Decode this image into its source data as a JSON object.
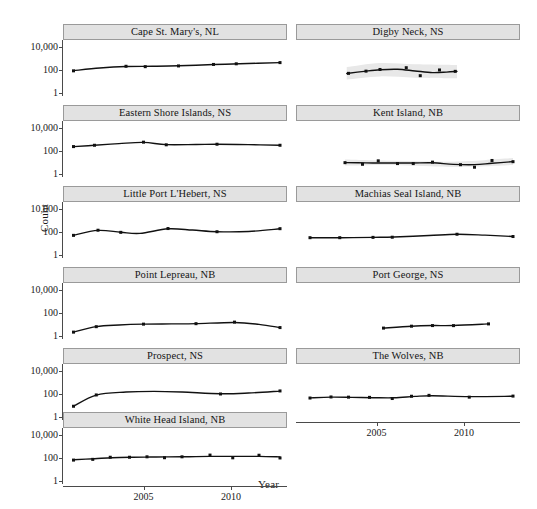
{
  "chart_data": {
    "type": "line",
    "title": "",
    "xlabel": "Year",
    "ylabel": "Count",
    "yscale": "log10",
    "ylim": [
      0.5,
      40000
    ],
    "yticks": [
      1,
      100,
      10000
    ],
    "ytick_labels": [
      "1",
      "100",
      "10,000"
    ],
    "xlim": [
      2000.4,
      2013.2
    ],
    "xticks": [
      2005,
      2010
    ],
    "xtick_labels": [
      "2005",
      "2010"
    ],
    "grid": false,
    "legend": null,
    "layout": {
      "rows": 6,
      "cols": 2,
      "strip_position": "top"
    },
    "marker": "filled-square",
    "line_color": "#111111",
    "band_color": "#e8e8e8",
    "strip_fill": "#e2e2e2",
    "panels": [
      {
        "id": "cape-st-marys-nl",
        "label": "Cape St. Mary's, NL",
        "row": 0,
        "col": 0,
        "has_band": false,
        "points": [
          {
            "x": 2001.0,
            "y": 80
          },
          {
            "x": 2004.0,
            "y": 200
          },
          {
            "x": 2005.1,
            "y": 185
          },
          {
            "x": 2007.0,
            "y": 215
          },
          {
            "x": 2009.0,
            "y": 290
          },
          {
            "x": 2010.3,
            "y": 330
          },
          {
            "x": 2012.8,
            "y": 420
          }
        ],
        "fit": [
          {
            "x": 2001.0,
            "y": 82
          },
          {
            "x": 2002.5,
            "y": 140
          },
          {
            "x": 2004.0,
            "y": 190
          },
          {
            "x": 2005.5,
            "y": 200
          },
          {
            "x": 2007.0,
            "y": 220
          },
          {
            "x": 2009.0,
            "y": 285
          },
          {
            "x": 2010.5,
            "y": 330
          },
          {
            "x": 2012.8,
            "y": 420
          }
        ]
      },
      {
        "id": "digby-neck-ns",
        "label": "Digby Neck, NS",
        "row": 0,
        "col": 1,
        "has_band": true,
        "points": [
          {
            "x": 2003.4,
            "y": 48
          },
          {
            "x": 2004.4,
            "y": 75
          },
          {
            "x": 2005.2,
            "y": 105
          },
          {
            "x": 2006.7,
            "y": 150
          },
          {
            "x": 2007.5,
            "y": 30
          },
          {
            "x": 2008.6,
            "y": 95
          },
          {
            "x": 2009.5,
            "y": 72
          }
        ],
        "fit": [
          {
            "x": 2003.3,
            "y": 47
          },
          {
            "x": 2004.3,
            "y": 72
          },
          {
            "x": 2005.2,
            "y": 100
          },
          {
            "x": 2006.2,
            "y": 110
          },
          {
            "x": 2007.2,
            "y": 78
          },
          {
            "x": 2008.2,
            "y": 56
          },
          {
            "x": 2009.0,
            "y": 62
          },
          {
            "x": 2009.6,
            "y": 72
          }
        ],
        "band": [
          {
            "x": 2003.3,
            "lo": 14,
            "hi": 170
          },
          {
            "x": 2005.2,
            "lo": 26,
            "hi": 390
          },
          {
            "x": 2007.2,
            "lo": 20,
            "hi": 300
          },
          {
            "x": 2009.6,
            "lo": 18,
            "hi": 260
          }
        ]
      },
      {
        "id": "eastern-shore-islands-ns",
        "label": "Eastern Shore Islands, NS",
        "row": 1,
        "col": 0,
        "has_band": false,
        "points": [
          {
            "x": 2001.0,
            "y": 230
          },
          {
            "x": 2002.2,
            "y": 300
          },
          {
            "x": 2005.0,
            "y": 560
          },
          {
            "x": 2006.3,
            "y": 330
          },
          {
            "x": 2009.2,
            "y": 370
          },
          {
            "x": 2012.8,
            "y": 300
          }
        ],
        "fit": [
          {
            "x": 2001.0,
            "y": 230
          },
          {
            "x": 2002.2,
            "y": 300
          },
          {
            "x": 2003.6,
            "y": 420
          },
          {
            "x": 2005.0,
            "y": 540
          },
          {
            "x": 2006.3,
            "y": 340
          },
          {
            "x": 2008.0,
            "y": 350
          },
          {
            "x": 2009.2,
            "y": 370
          },
          {
            "x": 2011.0,
            "y": 340
          },
          {
            "x": 2012.8,
            "y": 300
          }
        ]
      },
      {
        "id": "kent-island-nb",
        "label": "Kent Island, NB",
        "row": 1,
        "col": 1,
        "has_band": true,
        "points": [
          {
            "x": 2003.2,
            "y": 9
          },
          {
            "x": 2004.2,
            "y": 6.5
          },
          {
            "x": 2005.1,
            "y": 13
          },
          {
            "x": 2006.2,
            "y": 7.5
          },
          {
            "x": 2007.1,
            "y": 7.5
          },
          {
            "x": 2008.2,
            "y": 10
          },
          {
            "x": 2009.8,
            "y": 6
          },
          {
            "x": 2010.6,
            "y": 3.6
          },
          {
            "x": 2011.6,
            "y": 14
          },
          {
            "x": 2012.8,
            "y": 11
          }
        ],
        "fit": [
          {
            "x": 2003.2,
            "y": 9.0
          },
          {
            "x": 2004.4,
            "y": 8.6
          },
          {
            "x": 2005.6,
            "y": 8.4
          },
          {
            "x": 2007.0,
            "y": 8.4
          },
          {
            "x": 2008.2,
            "y": 8.8
          },
          {
            "x": 2009.4,
            "y": 6.4
          },
          {
            "x": 2010.6,
            "y": 6.0
          },
          {
            "x": 2011.6,
            "y": 8.0
          },
          {
            "x": 2012.8,
            "y": 11.0
          }
        ],
        "band": [
          {
            "x": 2003.2,
            "lo": 5.0,
            "hi": 17
          },
          {
            "x": 2006.0,
            "lo": 5.6,
            "hi": 13
          },
          {
            "x": 2009.4,
            "lo": 3.8,
            "hi": 11
          },
          {
            "x": 2012.8,
            "lo": 5.5,
            "hi": 23
          }
        ]
      },
      {
        "id": "little-port-lhebert-ns",
        "label": "Little Port L'Hebert, NS",
        "row": 2,
        "col": 0,
        "has_band": false,
        "points": [
          {
            "x": 2001.0,
            "y": 48
          },
          {
            "x": 2002.4,
            "y": 135
          },
          {
            "x": 2003.7,
            "y": 88
          },
          {
            "x": 2006.4,
            "y": 190
          },
          {
            "x": 2009.2,
            "y": 100
          },
          {
            "x": 2012.8,
            "y": 185
          }
        ],
        "fit": [
          {
            "x": 2001.0,
            "y": 50
          },
          {
            "x": 2002.4,
            "y": 130
          },
          {
            "x": 2003.7,
            "y": 90
          },
          {
            "x": 2004.8,
            "y": 72
          },
          {
            "x": 2006.4,
            "y": 180
          },
          {
            "x": 2007.8,
            "y": 140
          },
          {
            "x": 2009.2,
            "y": 100
          },
          {
            "x": 2011.0,
            "y": 105
          },
          {
            "x": 2012.8,
            "y": 180
          }
        ]
      },
      {
        "id": "machias-seal-island-nb",
        "label": "Machias Seal Island, NB",
        "row": 2,
        "col": 1,
        "has_band": false,
        "points": [
          {
            "x": 2001.2,
            "y": 30
          },
          {
            "x": 2002.9,
            "y": 30
          },
          {
            "x": 2004.8,
            "y": 32
          },
          {
            "x": 2005.9,
            "y": 33
          },
          {
            "x": 2009.6,
            "y": 60
          },
          {
            "x": 2012.8,
            "y": 38
          }
        ],
        "fit": [
          {
            "x": 2001.2,
            "y": 30
          },
          {
            "x": 2003.0,
            "y": 30
          },
          {
            "x": 2004.8,
            "y": 32
          },
          {
            "x": 2006.0,
            "y": 34
          },
          {
            "x": 2008.0,
            "y": 46
          },
          {
            "x": 2009.6,
            "y": 60
          },
          {
            "x": 2011.2,
            "y": 50
          },
          {
            "x": 2012.8,
            "y": 38
          }
        ]
      },
      {
        "id": "point-lepreau-nb",
        "label": "Point Lepreau, NB",
        "row": 3,
        "col": 0,
        "has_band": false,
        "points": [
          {
            "x": 2001.0,
            "y": 2.0
          },
          {
            "x": 2002.3,
            "y": 6.0
          },
          {
            "x": 2005.0,
            "y": 10
          },
          {
            "x": 2008.0,
            "y": 11
          },
          {
            "x": 2010.2,
            "y": 15
          },
          {
            "x": 2012.8,
            "y": 5.0
          }
        ],
        "fit": [
          {
            "x": 2001.0,
            "y": 2.0
          },
          {
            "x": 2002.3,
            "y": 6.0
          },
          {
            "x": 2003.6,
            "y": 8.4
          },
          {
            "x": 2005.0,
            "y": 10
          },
          {
            "x": 2006.6,
            "y": 10.5
          },
          {
            "x": 2008.0,
            "y": 11
          },
          {
            "x": 2010.2,
            "y": 14
          },
          {
            "x": 2011.6,
            "y": 9.5
          },
          {
            "x": 2012.8,
            "y": 5.0
          }
        ]
      },
      {
        "id": "port-george-ns",
        "label": "Port George, NS",
        "row": 3,
        "col": 1,
        "has_band": false,
        "points": [
          {
            "x": 2005.4,
            "y": 4.5
          },
          {
            "x": 2007.0,
            "y": 6.6
          },
          {
            "x": 2008.2,
            "y": 7.5
          },
          {
            "x": 2009.4,
            "y": 7.4
          },
          {
            "x": 2011.4,
            "y": 10.5
          }
        ],
        "fit": [
          {
            "x": 2005.4,
            "y": 4.5
          },
          {
            "x": 2007.0,
            "y": 6.6
          },
          {
            "x": 2008.2,
            "y": 7.5
          },
          {
            "x": 2009.4,
            "y": 7.6
          },
          {
            "x": 2011.4,
            "y": 10.5
          }
        ]
      },
      {
        "id": "prospect-ns",
        "label": "Prospect, NS",
        "row": 4,
        "col": 0,
        "has_band": false,
        "points": [
          {
            "x": 2001.0,
            "y": 8
          },
          {
            "x": 2002.3,
            "y": 78
          },
          {
            "x": 2009.4,
            "y": 95
          },
          {
            "x": 2012.8,
            "y": 175
          }
        ],
        "fit": [
          {
            "x": 2001.0,
            "y": 8
          },
          {
            "x": 2002.3,
            "y": 76
          },
          {
            "x": 2004.0,
            "y": 140
          },
          {
            "x": 2005.6,
            "y": 160
          },
          {
            "x": 2007.2,
            "y": 140
          },
          {
            "x": 2009.4,
            "y": 100
          },
          {
            "x": 2011.0,
            "y": 115
          },
          {
            "x": 2012.8,
            "y": 170
          }
        ]
      },
      {
        "id": "the-wolves-nb",
        "label": "The Wolves, NB",
        "row": 4,
        "col": 1,
        "has_band": false,
        "points": [
          {
            "x": 2001.2,
            "y": 42
          },
          {
            "x": 2002.4,
            "y": 52
          },
          {
            "x": 2003.4,
            "y": 50
          },
          {
            "x": 2004.6,
            "y": 48
          },
          {
            "x": 2005.9,
            "y": 38
          },
          {
            "x": 2007.0,
            "y": 60
          },
          {
            "x": 2008.0,
            "y": 72
          },
          {
            "x": 2010.3,
            "y": 50
          },
          {
            "x": 2012.8,
            "y": 62
          }
        ],
        "fit": [
          {
            "x": 2001.2,
            "y": 43
          },
          {
            "x": 2002.4,
            "y": 50
          },
          {
            "x": 2003.6,
            "y": 48
          },
          {
            "x": 2004.8,
            "y": 45
          },
          {
            "x": 2006.0,
            "y": 44
          },
          {
            "x": 2007.2,
            "y": 58
          },
          {
            "x": 2008.2,
            "y": 66
          },
          {
            "x": 2010.3,
            "y": 56
          },
          {
            "x": 2012.8,
            "y": 60
          }
        ]
      },
      {
        "id": "white-head-island-nb",
        "label": "White Head Island, NB",
        "row": 5,
        "col": 0,
        "has_band": false,
        "points": [
          {
            "x": 2001.0,
            "y": 62
          },
          {
            "x": 2002.1,
            "y": 72
          },
          {
            "x": 2003.1,
            "y": 110
          },
          {
            "x": 2004.2,
            "y": 110
          },
          {
            "x": 2005.2,
            "y": 120
          },
          {
            "x": 2006.2,
            "y": 100
          },
          {
            "x": 2007.2,
            "y": 120
          },
          {
            "x": 2008.8,
            "y": 170
          },
          {
            "x": 2010.1,
            "y": 98
          },
          {
            "x": 2011.6,
            "y": 165
          },
          {
            "x": 2012.8,
            "y": 95
          }
        ],
        "fit": [
          {
            "x": 2001.0,
            "y": 66
          },
          {
            "x": 2002.2,
            "y": 82
          },
          {
            "x": 2003.2,
            "y": 100
          },
          {
            "x": 2004.4,
            "y": 110
          },
          {
            "x": 2005.4,
            "y": 115
          },
          {
            "x": 2006.4,
            "y": 118
          },
          {
            "x": 2007.6,
            "y": 122
          },
          {
            "x": 2008.8,
            "y": 130
          },
          {
            "x": 2010.2,
            "y": 132
          },
          {
            "x": 2011.6,
            "y": 130
          },
          {
            "x": 2012.8,
            "y": 118
          }
        ]
      }
    ]
  }
}
